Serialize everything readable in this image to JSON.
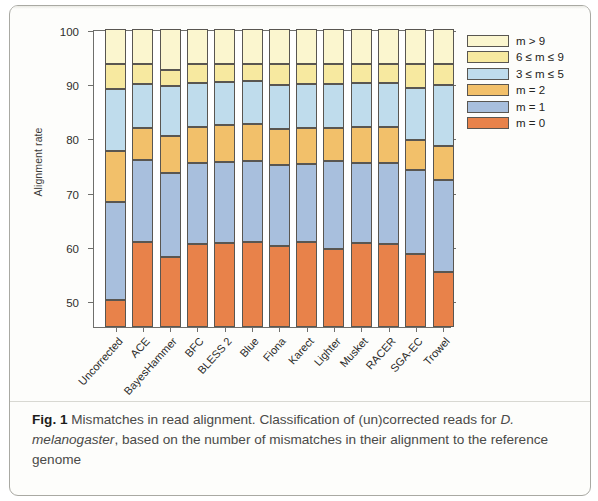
{
  "figure": {
    "caption_label": "Fig. 1",
    "caption_part1": " Mismatches in read alignment. Classification of (un)corrected reads for ",
    "caption_italic": "D. melanogaster",
    "caption_part2": ", based on the number of mismatches in their alignment to the reference genome"
  },
  "chart_data": {
    "type": "bar",
    "subtype": "stacked-bar",
    "title": "",
    "xlabel": "",
    "ylabel": "Alignment rate",
    "ylim": [
      45,
      100
    ],
    "yticks": [
      50,
      60,
      70,
      80,
      90,
      100
    ],
    "grid": false,
    "legend_position": "right",
    "categories": [
      "Uncorrected",
      "ACE",
      "BayesHammer",
      "BFC",
      "BLESS 2",
      "Blue",
      "Fiona",
      "Karect",
      "Lighter",
      "Musket",
      "RACER",
      "SGA-EC",
      "Trowel"
    ],
    "series": [
      {
        "name": "m = 0",
        "color": "#e8824a",
        "values": [
          50.0,
          60.6,
          57.9,
          60.3,
          60.5,
          60.6,
          59.9,
          60.6,
          59.4,
          60.5,
          60.3,
          58.4,
          55.1
        ]
      },
      {
        "name": "m = 1",
        "color": "#a8bfdd",
        "values": [
          18.0,
          15.2,
          15.6,
          15.0,
          15.0,
          15.0,
          15.0,
          14.4,
          16.2,
          14.8,
          15.0,
          15.6,
          17.1
        ]
      },
      {
        "name": "m = 2",
        "color": "#f2c06a",
        "values": [
          9.5,
          6.0,
          6.7,
          6.7,
          6.8,
          6.8,
          6.7,
          6.8,
          6.2,
          6.7,
          6.7,
          5.5,
          6.2
        ]
      },
      {
        "name": "3 ≤ m ≤ 5",
        "color": "#bfdcec",
        "values": [
          11.5,
          8.0,
          9.3,
          8.0,
          8.0,
          8.0,
          8.0,
          8.0,
          8.0,
          8.0,
          8.0,
          9.6,
          11.3
        ]
      },
      {
        "name": "6 ≤ m ≤ 9",
        "color": "#f7e9a0",
        "values": [
          4.5,
          3.7,
          3.0,
          3.5,
          3.2,
          3.1,
          3.9,
          3.7,
          3.7,
          3.5,
          3.5,
          4.4,
          3.8
        ]
      },
      {
        "name": "m > 9",
        "color": "#fbf6cf",
        "values": [
          6.5,
          6.5,
          7.5,
          6.5,
          6.5,
          6.5,
          6.5,
          6.5,
          6.5,
          6.5,
          6.5,
          6.5,
          6.5
        ]
      }
    ],
    "legend_entries": [
      {
        "label": "m > 9",
        "color": "#fbf6cf"
      },
      {
        "label": "6 ≤ m ≤ 9",
        "color": "#f7e9a0"
      },
      {
        "label": "3 ≤ m ≤ 5",
        "color": "#bfdcec"
      },
      {
        "label": "m = 2",
        "color": "#f2c06a"
      },
      {
        "label": "m = 1",
        "color": "#a8bfdd"
      },
      {
        "label": "m = 0",
        "color": "#e8824a"
      }
    ]
  }
}
